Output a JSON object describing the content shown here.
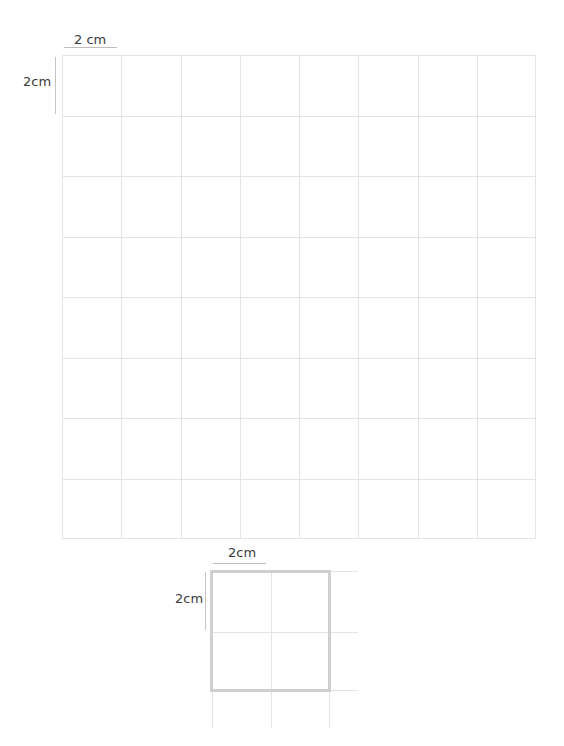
{
  "big_grid": {
    "top_label": "2 cm",
    "left_label": "2cm",
    "rows": 8,
    "cols": 8,
    "line_color": "#e4e4e4"
  },
  "small_square": {
    "top_label": "2cm",
    "left_label": "2cm",
    "border_color": "#cfcfcf",
    "line_color": "#e4e4e4"
  }
}
